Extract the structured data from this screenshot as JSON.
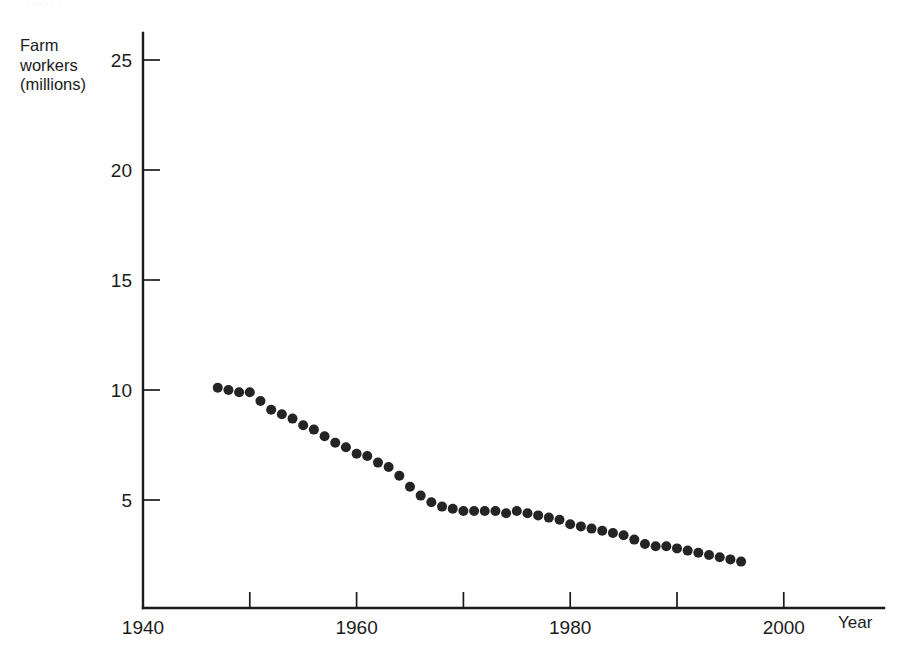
{
  "page": {
    "background_color": "#ffffff",
    "top_sliver_text": "· · · · · ·"
  },
  "axes": {
    "y_title": "Farm\nworkers\n(millions)",
    "x_title": "Year",
    "y_ticks": [
      {
        "label": "25",
        "value": 25
      },
      {
        "label": "20",
        "value": 20
      },
      {
        "label": "15",
        "value": 15
      },
      {
        "label": "10",
        "value": 10
      },
      {
        "label": "5",
        "value": 5
      }
    ],
    "x_ticks": [
      {
        "label": "1940",
        "value": 1940,
        "major": true
      },
      {
        "label": "",
        "value": 1950,
        "major": false
      },
      {
        "label": "1960",
        "value": 1960,
        "major": true
      },
      {
        "label": "",
        "value": 1970,
        "major": false
      },
      {
        "label": "1980",
        "value": 1980,
        "major": true
      },
      {
        "label": "",
        "value": 1990,
        "major": false
      },
      {
        "label": "2000",
        "value": 2000,
        "major": true
      }
    ]
  },
  "chart_data": {
    "type": "scatter",
    "title": "",
    "subtitle": "",
    "xlabel": "Year",
    "ylabel": "Farm workers (millions)",
    "xlim": [
      1940,
      2009
    ],
    "ylim": [
      0,
      26.6
    ],
    "grid": false,
    "legend": null,
    "marker": {
      "shape": "circle",
      "color": "#242424",
      "diameter_px": 10
    },
    "x": [
      1947,
      1948,
      1949,
      1950,
      1951,
      1952,
      1953,
      1954,
      1955,
      1956,
      1957,
      1958,
      1959,
      1960,
      1961,
      1962,
      1963,
      1964,
      1965,
      1966,
      1967,
      1968,
      1969,
      1970,
      1971,
      1972,
      1973,
      1974,
      1975,
      1976,
      1977,
      1978,
      1979,
      1980,
      1981,
      1982,
      1983,
      1984,
      1985,
      1986,
      1987,
      1988,
      1989,
      1990,
      1991,
      1992,
      1993,
      1994,
      1995,
      1996
    ],
    "y": [
      10.1,
      10.0,
      9.9,
      9.9,
      9.5,
      9.1,
      8.9,
      8.7,
      8.4,
      8.2,
      7.9,
      7.6,
      7.4,
      7.1,
      7.0,
      6.7,
      6.5,
      6.1,
      5.6,
      5.2,
      4.9,
      4.7,
      4.6,
      4.5,
      4.5,
      4.5,
      4.5,
      4.4,
      4.5,
      4.4,
      4.3,
      4.2,
      4.1,
      3.9,
      3.8,
      3.7,
      3.6,
      3.5,
      3.4,
      3.2,
      3.0,
      2.9,
      2.9,
      2.8,
      2.7,
      2.6,
      2.5,
      2.4,
      2.3,
      2.2
    ]
  }
}
